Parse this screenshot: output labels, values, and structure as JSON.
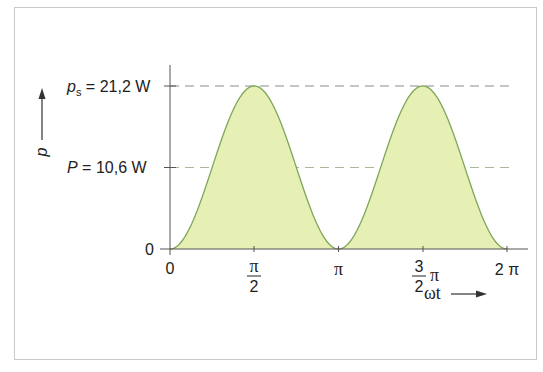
{
  "chart_data": {
    "type": "area",
    "title": "",
    "xlabel": "ωt",
    "ylabel": "p",
    "x_ticks": [
      "0",
      "π/2",
      "π",
      "3/2 π",
      "2 π"
    ],
    "x_tick_values": [
      0,
      1.5708,
      3.1416,
      4.7124,
      6.2832
    ],
    "y_ticks": [
      "0",
      "P = 10,6 W",
      "ps = 21,2 W"
    ],
    "y_tick_values": [
      0,
      10.6,
      21.2
    ],
    "xlim": [
      0,
      6.2832
    ],
    "ylim": [
      0,
      21.2
    ],
    "grid": false,
    "legend": null,
    "series": [
      {
        "name": "p(ωt) = ps · sin²(ωt)",
        "x": [
          0,
          0.3927,
          0.7854,
          1.1781,
          1.5708,
          1.9635,
          2.3562,
          2.7489,
          3.1416,
          3.5343,
          3.927,
          4.3197,
          4.7124,
          5.1051,
          5.4978,
          5.8905,
          6.2832
        ],
        "values": [
          0,
          3.1,
          10.6,
          18.1,
          21.2,
          18.1,
          10.6,
          3.1,
          0,
          3.1,
          10.6,
          18.1,
          21.2,
          18.1,
          10.6,
          3.1,
          0
        ]
      }
    ],
    "reference_lines": [
      {
        "label": "ps = 21,2 W",
        "value": 21.2,
        "style": "dashed"
      },
      {
        "label": "P = 10,6 W",
        "value": 10.6,
        "style": "dashed"
      }
    ]
  },
  "labels": {
    "ps_symbol": "p",
    "ps_sub": "s",
    "ps_value": " = 21,2 W",
    "P_symbol": "P",
    "P_value": " = 10,6 W",
    "zero_y": "0",
    "zero_x": "0",
    "half_pi_num": "π",
    "half_pi_den": "2",
    "pi": "π",
    "three_half_num": "3",
    "three_half_den": "2",
    "three_half_pi": "π",
    "two_pi": "2 π",
    "x_axis_label": "ωt",
    "y_axis_label": "p"
  },
  "colors": {
    "fill": "#e6f0b4",
    "stroke": "#7fa65a",
    "axis": "#555555",
    "ref_line_top": "#8a8a8a",
    "ref_line_mid": "#9fb38a",
    "frame": "#c9c9c9"
  }
}
